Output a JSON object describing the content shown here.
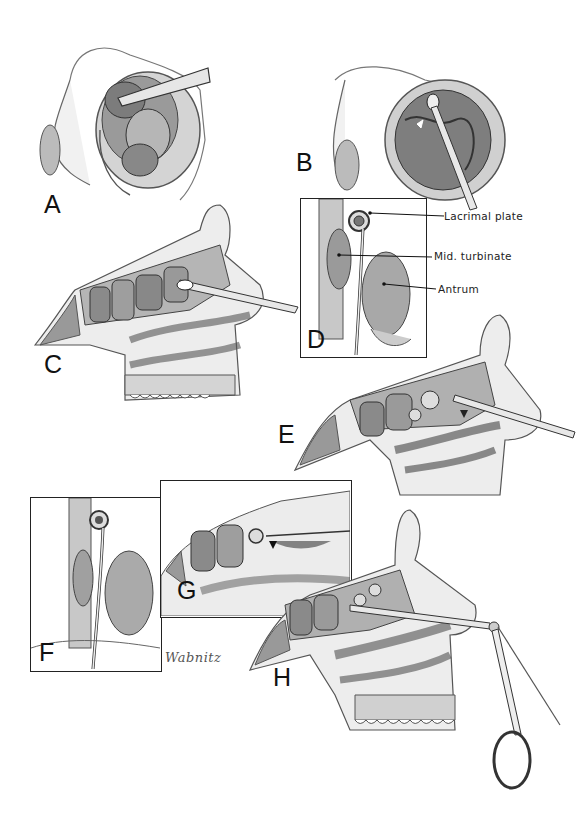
{
  "figure": {
    "panels": [
      {
        "id": "A",
        "label": "A",
        "description": "External nose view with speculum opening nasal cavity"
      },
      {
        "id": "B",
        "label": "B",
        "description": "External nose view with instrument at anterior ethmoid"
      },
      {
        "id": "C",
        "label": "C",
        "description": "Sagittal section with instrument in ethmoid cells"
      },
      {
        "id": "D",
        "label": "D",
        "description": "Coronal inset of lateral nasal wall"
      },
      {
        "id": "E",
        "label": "E",
        "description": "Sagittal section, curette opening ethmoid cells"
      },
      {
        "id": "F",
        "label": "F",
        "description": "Coronal inset with instrument"
      },
      {
        "id": "G",
        "label": "G",
        "description": "Close-up sagittal view of opened ethmoid cells"
      },
      {
        "id": "H",
        "label": "H",
        "description": "Sagittal section with angled forceps"
      }
    ],
    "callouts": [
      {
        "text": "Lacrimal plate"
      },
      {
        "text": "Mid. turbinate"
      },
      {
        "text": "Antrum"
      }
    ],
    "signature": "Wabnitz"
  }
}
